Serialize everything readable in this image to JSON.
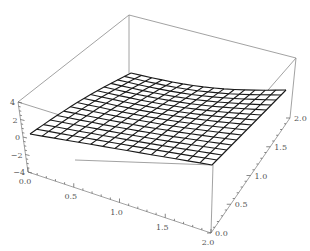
{
  "chart_data": {
    "type": "surface3d",
    "title": "",
    "x_axis": {
      "label": "",
      "range": [
        0,
        2
      ],
      "ticks": [
        "0.0",
        "0.5",
        "1.0",
        "1.5",
        "2.0"
      ]
    },
    "y_axis": {
      "label": "",
      "range": [
        0,
        2
      ],
      "ticks": [
        "0.0",
        "0.5",
        "1.0",
        "1.5",
        "2.0"
      ]
    },
    "z_axis": {
      "label": "",
      "range": [
        -4,
        4
      ],
      "ticks": [
        "4",
        "2",
        "0",
        "-2",
        "-4"
      ]
    },
    "mesh": {
      "cells_x": 15,
      "cells_y": 15
    },
    "surface_description": "Smooth, gently saddle-shaped surface near z≈0, sagging slightly along the back-right edge",
    "box": true,
    "colors": {
      "mesh": "#1a1a1a",
      "box": "#8a8a8a",
      "labels": "#555555"
    }
  }
}
